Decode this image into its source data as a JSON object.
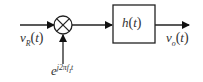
{
  "diagram": {
    "type": "block-diagram",
    "input_signal": {
      "symbol": "v",
      "subscript": "R",
      "arg": "t"
    },
    "mixer": {
      "symbol": "multiplier",
      "icon": "circle-x-icon"
    },
    "oscillator": {
      "base": "e",
      "exponent": "j2πf",
      "exponent_sub": "I",
      "exponent_tail": "t"
    },
    "filter": {
      "label": "h",
      "arg": "t"
    },
    "output_signal": {
      "symbol": "v",
      "subscript": "o",
      "arg": "t"
    },
    "colors": {
      "line": "#222222",
      "text": "#333333",
      "background": "#ffffff"
    }
  }
}
